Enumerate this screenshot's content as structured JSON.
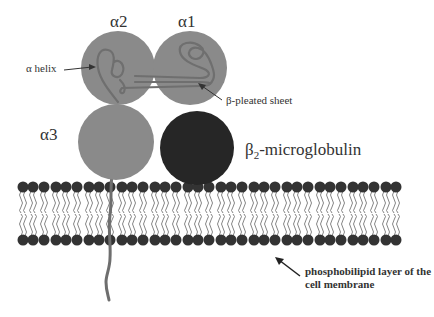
{
  "diagram": {
    "labels": {
      "alpha2": "α2",
      "alpha1": "α1",
      "alpha3": "α3",
      "alpha_helix": "α helix",
      "beta_sheet": "β-pleated sheet",
      "b2m_prefix": "β",
      "b2m_sub": "2",
      "b2m_suffix": "-microglobulin",
      "membrane_line1": "phosphobilipid layer of the",
      "membrane_line2": "cell membrane"
    },
    "colors": {
      "domain_fill": "#8a8a8a",
      "b2m_fill": "#262626",
      "lipid_head": "#333333",
      "lipid_tail": "#777777",
      "chain": "#6e6e6e",
      "text": "#333333"
    },
    "components": [
      {
        "name": "alpha2-domain",
        "cx": 118,
        "cy": 68,
        "r": 37
      },
      {
        "name": "alpha1-domain",
        "cx": 190,
        "cy": 68,
        "r": 37
      },
      {
        "name": "alpha3-domain",
        "cx": 116,
        "cy": 142,
        "r": 38
      },
      {
        "name": "beta2-microglobulin",
        "cx": 197,
        "cy": 148,
        "r": 37
      }
    ],
    "membrane": {
      "x_start": 22,
      "x_end": 404,
      "top_heads_y": 187,
      "bottom_heads_y": 240,
      "head_r": 5.5,
      "spacing": 11
    }
  }
}
